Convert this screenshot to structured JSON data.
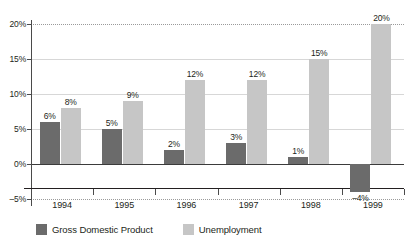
{
  "chart_data": {
    "type": "bar",
    "title": "",
    "xlabel": "",
    "ylabel": "",
    "categories": [
      "1994",
      "1995",
      "1996",
      "1997",
      "1998",
      "1999"
    ],
    "series": [
      {
        "name": "Gross Domestic Product",
        "color": "#6b6b6b",
        "values": [
          6,
          5,
          2,
          3,
          1,
          -4
        ],
        "labels": [
          "6%",
          "5%",
          "2%",
          "3%",
          "1%",
          "–4%"
        ]
      },
      {
        "name": "Unemployment",
        "color": "#c6c6c6",
        "values": [
          8,
          9,
          12,
          12,
          15,
          20
        ],
        "labels": [
          "8%",
          "9%",
          "12%",
          "12%",
          "15%",
          "20%"
        ]
      }
    ],
    "ylim": [
      -5,
      20
    ],
    "yticks": [
      20,
      15,
      10,
      5,
      0,
      -5
    ],
    "ytick_labels": [
      "20%",
      "15%",
      "10%",
      "5%",
      "0%",
      "–5%"
    ],
    "grid": true,
    "legend_position": "bottom-left",
    "value_labels_shown": true
  },
  "legend": {
    "items": [
      {
        "label": "Gross Domestic Product",
        "swatch": "gdp"
      },
      {
        "label": "Unemployment",
        "swatch": "unemp"
      }
    ]
  }
}
